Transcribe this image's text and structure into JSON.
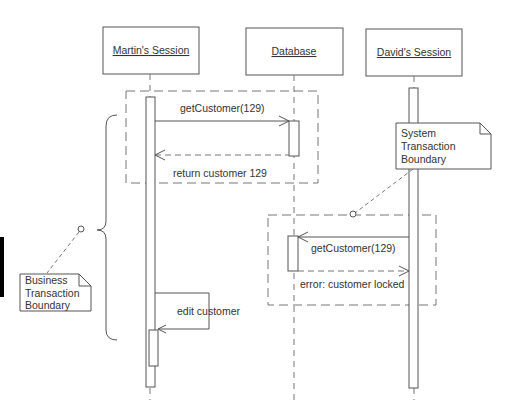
{
  "diagram": {
    "type": "sequence",
    "participants": [
      {
        "id": "martin",
        "label": "Martin's Session",
        "x": 150
      },
      {
        "id": "database",
        "label": "Database",
        "x": 294
      },
      {
        "id": "david",
        "label": "David's Session",
        "x": 414
      }
    ],
    "messages": [
      {
        "from": "martin",
        "to": "database",
        "label": "getCustomer(129)",
        "style": "solid"
      },
      {
        "from": "database",
        "to": "martin",
        "label": "return customer 129",
        "style": "dashed"
      },
      {
        "from": "david",
        "to": "database",
        "label": "getCustomer(129)",
        "style": "solid"
      },
      {
        "from": "database",
        "to": "david",
        "label": "error: customer locked",
        "style": "dashed"
      },
      {
        "from": "martin",
        "to": "martin",
        "label": "edit customer",
        "style": "solid"
      }
    ],
    "notes": {
      "system": [
        "System",
        "Transaction",
        "Boundary"
      ],
      "business": [
        "Business",
        "Transaction",
        "Boundary"
      ]
    },
    "colors": {
      "line": "#555555",
      "dash": "#777777",
      "text": "#333333",
      "bar": "#000000"
    }
  }
}
